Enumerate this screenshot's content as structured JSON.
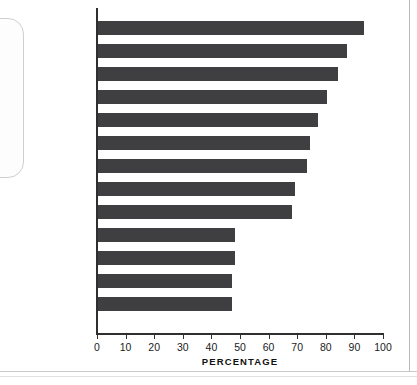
{
  "callout": {
    "name": "rounded-callout-box"
  },
  "chart_data": {
    "type": "bar",
    "orientation": "horizontal",
    "title": "",
    "xlabel": "PERCENTAGE",
    "ylabel": "",
    "xlim": [
      0,
      100
    ],
    "xticks": [
      0,
      10,
      20,
      30,
      40,
      50,
      60,
      70,
      80,
      90,
      100
    ],
    "grid": false,
    "legend": null,
    "bar_color": "#3f3f42",
    "axis_color": "#2f2f2f",
    "categories": [
      "Italy",
      "Australia",
      "Sweden",
      "Germany",
      "Spain",
      "United Kingdom",
      "Turkey",
      "Canada",
      "France",
      "United States",
      "Mexico",
      "Brazil",
      "Thailand"
    ],
    "values": [
      93,
      87,
      84,
      80,
      77,
      74,
      73,
      69,
      68,
      48,
      48,
      47,
      47
    ]
  }
}
